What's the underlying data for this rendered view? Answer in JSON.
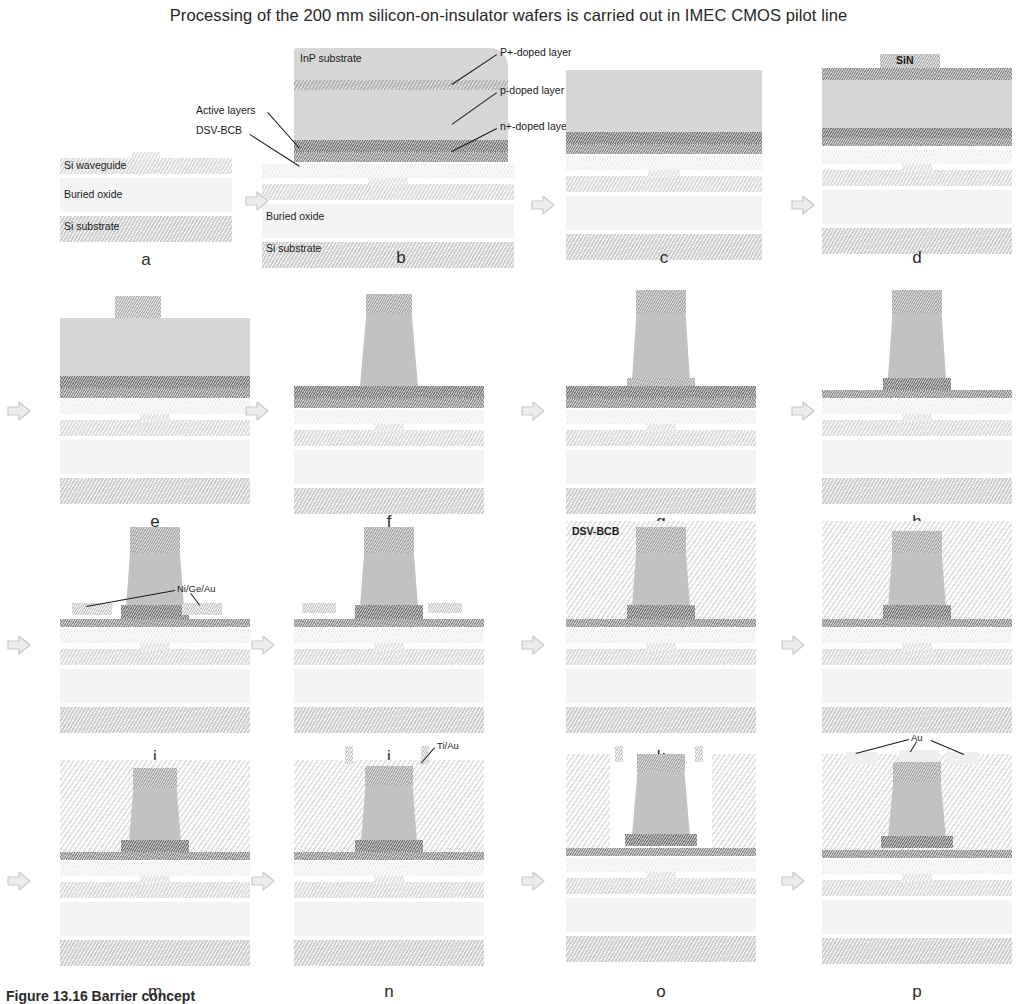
{
  "title": "Processing of the 200 mm silicon-on-insulator wafers is carried out in IMEC CMOS pilot line",
  "caption": "Figure 13.16  Barrier concept",
  "steps": [
    {
      "letter": "a",
      "name": "soi-starting-wafer"
    },
    {
      "letter": "b",
      "name": "inp-die-bonded"
    },
    {
      "letter": "c",
      "name": "inp-substrate-removed"
    },
    {
      "letter": "d",
      "name": "sin-hard-mask-deposited"
    },
    {
      "letter": "e",
      "name": "sin-mask-patterned"
    },
    {
      "letter": "f",
      "name": "p-mesa-etched"
    },
    {
      "letter": "g",
      "name": "mesa-sidewall-defined"
    },
    {
      "letter": "h",
      "name": "n-contact-layer-exposed"
    },
    {
      "letter": "i",
      "name": "nigeau-n-metal-deposited"
    },
    {
      "letter": "j",
      "name": "n-metal-patterned"
    },
    {
      "letter": "k",
      "name": "bcb-planarisation"
    },
    {
      "letter": "l",
      "name": "bcb-etch-back"
    },
    {
      "letter": "m",
      "name": "via-opened"
    },
    {
      "letter": "n",
      "name": "tiau-seed-metal"
    },
    {
      "letter": "o",
      "name": "plating-mould-opened"
    },
    {
      "letter": "p",
      "name": "au-plated-contacts"
    }
  ],
  "labels": {
    "si_waveguide": "Si waveguide",
    "buried_oxide": "Buried oxide",
    "si_substrate": "Si substrate",
    "inp_substrate": "InP substrate",
    "p_plus_doped": "P+-doped layer",
    "p_doped": "p-doped layer",
    "n_plus_doped": "n+-doped layer",
    "active_layers": "Active layers",
    "dsv_bcb": "DSV-BCB",
    "sin": "SiN",
    "nigeau": "Ni/Ge/Au",
    "tiau": "Ti/Au",
    "au": "Au"
  },
  "colors": {
    "background": "#ffffff",
    "si_substrate": "#cfcfcf",
    "buried_oxide": "#f4f4f4",
    "si_waveguide": "#dcdcdc",
    "bcb": "#f0f0f0",
    "inp_substrate": "#d6d6d6",
    "n_doped": "#8d8d8d",
    "p_doped": "#b6b6b6",
    "active_layer": "#7b7b7b",
    "sin_mask": "#b0b0b0",
    "metal": "#c8c8c8",
    "mesa": "#c2c2c2",
    "text": "#1d1d1d"
  },
  "layout": {
    "rows": 4,
    "columns": 4,
    "panel_width": 200,
    "arrow_glyph": "block-arrow-right"
  }
}
